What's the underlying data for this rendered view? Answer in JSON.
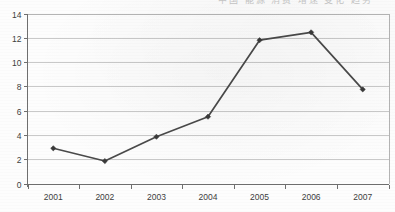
{
  "header": {
    "clipped_text": "中国 能源 消费 增速 变化 趋势",
    "note": "top row of text is cut off at the image edge"
  },
  "chart_data": {
    "type": "line",
    "title": "",
    "subtitle": "",
    "xlabel": "",
    "ylabel": "",
    "categories": [
      "2001",
      "2002",
      "2003",
      "2004",
      "2005",
      "2006",
      "2007"
    ],
    "values": [
      2.9,
      1.85,
      3.85,
      5.5,
      11.8,
      12.45,
      7.75
    ],
    "series": [
      {
        "name": "series-1",
        "values": [
          2.9,
          1.85,
          3.85,
          5.5,
          11.8,
          12.45,
          7.75
        ],
        "line_color": "#4a4a4a",
        "marker": "diamond",
        "marker_color": "#3a3a3a"
      }
    ],
    "ylim": [
      0,
      14
    ],
    "yticks": [
      0,
      2,
      4,
      6,
      8,
      10,
      12,
      14
    ],
    "ytick_labels": [
      "0",
      "2",
      "4",
      "6",
      "8",
      "10",
      "12",
      "14"
    ],
    "xtick_labels": [
      "2001",
      "2002",
      "2003",
      "2004",
      "2005",
      "2006",
      "2007"
    ],
    "grid": true,
    "grid_axis": "y",
    "grid_color": "#c9c9c9",
    "legend": false,
    "legend_position": "none",
    "background_color": "#fdfdfd",
    "axis_color": "#6f6f6f",
    "annotations": []
  }
}
